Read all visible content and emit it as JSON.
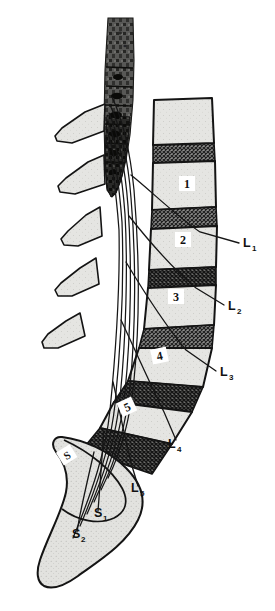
{
  "figure": {
    "background_color": "#ffffff",
    "width": 275,
    "height": 611
  },
  "palette": {
    "bone_fill": "#e3e3e1",
    "bone_fill_light": "#eaeae7",
    "outline": "#141414",
    "disc_fill": "#6f6f6f",
    "disc_hatch": "#2a2a2a",
    "cord_dark": "#3a3a38",
    "cord_darker": "#1c1c1a",
    "sacrum_fill": "#e0e0dd",
    "label_box": "#ffffff",
    "nerve_line": "#161616"
  },
  "vertebral_bodies": [
    {
      "id": "body-l1",
      "number": "1",
      "label_x": 187,
      "label_y": 186
    },
    {
      "id": "body-l2",
      "number": "2",
      "label_x": 183,
      "label_y": 242
    },
    {
      "id": "body-l3",
      "number": "3",
      "label_x": 176,
      "label_y": 299
    },
    {
      "id": "body-l4",
      "number": "4",
      "label_x": 160,
      "label_y": 358
    },
    {
      "id": "body-l5",
      "number": "5",
      "label_x": 128,
      "label_y": 409
    },
    {
      "id": "body-sacrum",
      "number": "S",
      "label_x": 68,
      "label_y": 457
    }
  ],
  "nerve_labels": [
    {
      "id": "label-l1",
      "text": "L",
      "sub": "1",
      "x": 243,
      "y": 247
    },
    {
      "id": "label-l2",
      "text": "L",
      "sub": "2",
      "x": 228,
      "y": 310
    },
    {
      "id": "label-l3",
      "text": "L",
      "sub": "3",
      "x": 220,
      "y": 376
    },
    {
      "id": "label-l4",
      "text": "L",
      "sub": "4",
      "x": 168,
      "y": 448
    },
    {
      "id": "label-l5",
      "text": "L",
      "sub": "5",
      "x": 131,
      "y": 492
    },
    {
      "id": "label-s1",
      "text": "S",
      "sub": "1",
      "x": 94,
      "y": 517
    },
    {
      "id": "label-s2",
      "text": "S",
      "sub": "2",
      "x": 72,
      "y": 538
    }
  ],
  "structures": {
    "spinal_cord": "conus medullaris and lower spinal cord",
    "cauda_equina": "bundle of descending nerve roots",
    "spinous_processes_count": 5,
    "intervertebral_discs_count": 6,
    "sacrum": "sacrum"
  }
}
